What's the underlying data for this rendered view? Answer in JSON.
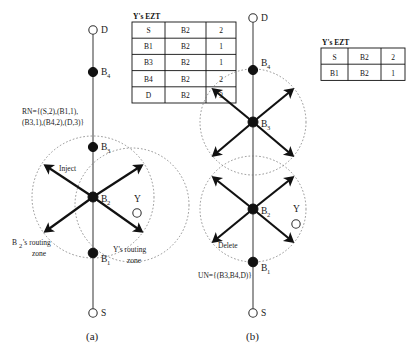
{
  "figure": {
    "panels": [
      {
        "id": "a",
        "caption": "(a)",
        "table": {
          "title": "Y's EZT",
          "rows": [
            [
              "S",
              "B2",
              "2"
            ],
            [
              "B1",
              "B2",
              "1"
            ],
            [
              "B3",
              "B2",
              "1"
            ],
            [
              "B4",
              "B2",
              "2"
            ],
            [
              "D",
              "B2",
              "3"
            ]
          ]
        },
        "set_label": {
          "line1": "RN={(S,2),(B1,1),",
          "line2": "(B3,1),(B4,2),(D,3)}"
        },
        "nodes": [
          {
            "name": "D",
            "type": "open"
          },
          {
            "name": "B",
            "sub": "4",
            "type": "filled"
          },
          {
            "name": "B",
            "sub": "3",
            "type": "filled"
          },
          {
            "name": "B",
            "sub": "2",
            "type": "filled"
          },
          {
            "name": "B",
            "sub": "1",
            "type": "filled"
          },
          {
            "name": "S",
            "type": "open"
          },
          {
            "name": "Y",
            "type": "open"
          }
        ],
        "annotations": [
          {
            "text": "Inject"
          },
          {
            "text": "B",
            "sub": "2",
            "text2": "'s routing",
            "text3": "zone"
          },
          {
            "text": "Y's routing",
            "text2": "zone"
          }
        ]
      },
      {
        "id": "b",
        "caption": "(b)",
        "table": {
          "title": "Y's EZT",
          "rows": [
            [
              "S",
              "B2",
              "2"
            ],
            [
              "B1",
              "B2",
              "1"
            ]
          ]
        },
        "set_label": {
          "line1": "UN={(B3,B4,D)}"
        },
        "nodes": [
          {
            "name": "D",
            "type": "open"
          },
          {
            "name": "B",
            "sub": "4",
            "type": "filled"
          },
          {
            "name": "B",
            "sub": "3",
            "type": "filled"
          },
          {
            "name": "B",
            "sub": "2",
            "type": "filled"
          },
          {
            "name": "B",
            "sub": "1",
            "type": "filled"
          },
          {
            "name": "S",
            "type": "open"
          },
          {
            "name": "Y",
            "type": "open"
          }
        ],
        "annotations": [
          {
            "text": "Delete"
          }
        ]
      }
    ],
    "node_labels": {
      "D": "D",
      "S": "S",
      "Y": "Y",
      "B": "B",
      "sub1": "1",
      "sub2": "2",
      "sub3": "3",
      "sub4": "4"
    },
    "colors": {
      "node": "#111111",
      "zone": "#777777",
      "axis": "#555555",
      "arrow": "#111111",
      "background": "#ffffff"
    }
  }
}
